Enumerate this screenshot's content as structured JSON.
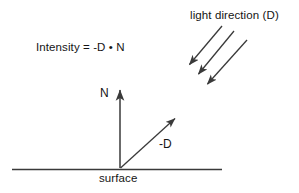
{
  "figure": {
    "name": "lambert-diffuse-lighting-diagram",
    "type": "vector-diagram",
    "width": 299,
    "height": 193,
    "background_color": "#ffffff",
    "stroke_color": "#3a3a3a",
    "text_color": "#141414"
  },
  "labels": {
    "light_direction": "light direction (D)",
    "intensity_formula": "Intensity = -D • N",
    "normal_vector": "N",
    "negative_light_vector": "-D",
    "surface": "surface"
  },
  "geometry": {
    "origin": {
      "x": 120,
      "y": 168
    },
    "surface_line": {
      "x1": 12,
      "y1": 169,
      "x2": 222,
      "y2": 169
    },
    "normal_arrow": {
      "x1": 120,
      "y1": 168,
      "x2": 120,
      "y2": 88
    },
    "neg_d_arrow": {
      "x1": 120,
      "y1": 168,
      "x2": 176,
      "y2": 117
    },
    "light_rays": [
      {
        "x1": 222,
        "y1": 26,
        "x2": 188,
        "y2": 66
      },
      {
        "x1": 234,
        "y1": 31,
        "x2": 197,
        "y2": 76
      },
      {
        "x1": 247,
        "y1": 40,
        "x2": 206,
        "y2": 86
      }
    ]
  },
  "text_positions": {
    "light_direction": {
      "x": 190,
      "y": 19
    },
    "intensity_formula": {
      "x": 36,
      "y": 51
    },
    "normal_vector": {
      "x": 100,
      "y": 97
    },
    "negative_light_vector": {
      "x": 159,
      "y": 148
    },
    "surface": {
      "x": 99,
      "y": 182
    }
  }
}
